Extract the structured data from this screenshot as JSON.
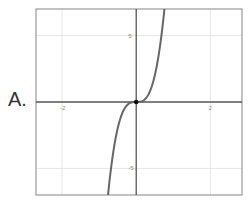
{
  "option_label": "A.",
  "chart_data": {
    "type": "line",
    "title": "",
    "xlabel": "",
    "ylabel": "",
    "xlim": [
      -2.7,
      2.85
    ],
    "ylim": [
      -7,
      7
    ],
    "grid": true,
    "x_ticks": [
      {
        "value": -2,
        "label": "-2"
      },
      {
        "value": 2,
        "label": "2"
      }
    ],
    "y_ticks": [
      {
        "value": 5,
        "label": "5"
      },
      {
        "value": -5,
        "label": "-5"
      }
    ],
    "series": [
      {
        "name": "f(x)",
        "expression": "y = a·x^3 (steep cubic through origin)",
        "x": [
          -0.76,
          -0.6,
          -0.4,
          -0.2,
          0,
          0.2,
          0.4,
          0.6,
          0.76
        ],
        "y": [
          -7.0,
          -3.5,
          -1.0,
          -0.13,
          0,
          0.13,
          1.0,
          3.5,
          7.0
        ]
      }
    ],
    "points": [
      {
        "x": 0,
        "y": 0,
        "label": "origin dot"
      }
    ],
    "colors": {
      "curve": "#666666",
      "axes": "#555555",
      "grid": "#e6e6e6",
      "frame": "#999999"
    }
  }
}
